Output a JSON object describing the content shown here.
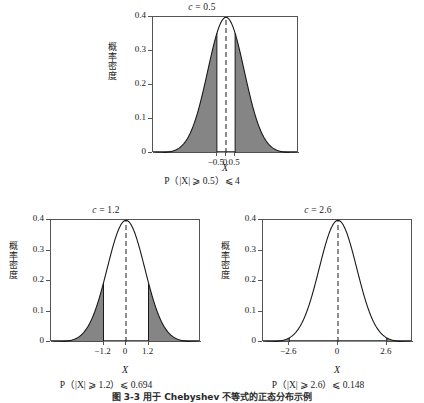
{
  "figure": {
    "caption": "图 3-3  用于 Chebyshev 不等式的正态分布示例",
    "axis_label_y": "概率密度",
    "axis_label_x": "X"
  },
  "chart_data": [
    {
      "id": "top",
      "type": "area",
      "title": "c = 0.5",
      "c_symbol": "c",
      "c_equals": " = ",
      "c_value": "0.5",
      "xlabel": "X",
      "ylabel": "概率密度",
      "caption": "P（|X| ⩾ 0.5）⩽ 4",
      "ylim": [
        0,
        0.4
      ],
      "yticks": [
        0,
        0.1,
        0.2,
        0.3,
        0.4
      ],
      "ytick_labels": [
        "0",
        "0.1",
        "0.2",
        "0.3",
        "0.4"
      ],
      "xlim": [
        -4,
        4
      ],
      "xticks": [
        -0.5,
        0,
        0.5
      ],
      "xtick_labels": [
        "−0.5",
        "0",
        "0.5"
      ],
      "distribution": "standard-normal",
      "mean": 0,
      "sd": 1,
      "peak_density": 0.3989,
      "threshold": 0.5,
      "shaded_tails": [
        [
          -4,
          -0.5
        ],
        [
          0.5,
          4
        ]
      ],
      "shade_color": "#858585",
      "curve_color": "#1a1a1a",
      "dashed_center_line_x": 0,
      "grid": false,
      "legend": "none"
    },
    {
      "id": "bottom-left",
      "type": "area",
      "title": "c = 1.2",
      "c_symbol": "c",
      "c_equals": " = ",
      "c_value": "1.2",
      "xlabel": "X",
      "ylabel": "概率密度",
      "caption": "P（|X| ⩾ 1.2）⩽ 0.694",
      "ylim": [
        0,
        0.4
      ],
      "yticks": [
        0,
        0.1,
        0.2,
        0.3,
        0.4
      ],
      "ytick_labels": [
        "0",
        "0.1",
        "0.2",
        "0.3",
        "0.4"
      ],
      "xlim": [
        -4,
        4
      ],
      "xticks": [
        -1.2,
        0,
        1.2
      ],
      "xtick_labels": [
        "−1.2",
        "0",
        "1.2"
      ],
      "distribution": "standard-normal",
      "mean": 0,
      "sd": 1,
      "peak_density": 0.3989,
      "threshold": 1.2,
      "shaded_tails": [
        [
          -4,
          -1.2
        ],
        [
          1.2,
          4
        ]
      ],
      "shade_color": "#858585",
      "curve_color": "#1a1a1a",
      "dashed_center_line_x": 0,
      "grid": false,
      "legend": "none"
    },
    {
      "id": "bottom-right",
      "type": "area",
      "title": "c = 2.6",
      "c_symbol": "c",
      "c_equals": " = ",
      "c_value": "2.6",
      "xlabel": "X",
      "ylabel": "概率密度",
      "caption": "P（|X| ⩾ 2.6）⩽ 0.148",
      "ylim": [
        0,
        0.4
      ],
      "yticks": [
        0,
        0.1,
        0.2,
        0.3,
        0.4
      ],
      "ytick_labels": [
        "0",
        "0.1",
        "0.2",
        "0.3",
        "0.4"
      ],
      "xlim": [
        -4,
        4
      ],
      "xticks": [
        -2.6,
        0,
        2.6
      ],
      "xtick_labels": [
        "−2.6",
        "0",
        "2.6"
      ],
      "distribution": "standard-normal",
      "mean": 0,
      "sd": 1,
      "peak_density": 0.3989,
      "threshold": 2.6,
      "shaded_tails": [
        [
          -4,
          -2.6
        ],
        [
          2.6,
          4
        ]
      ],
      "shade_color": "#858585",
      "curve_color": "#1a1a1a",
      "dashed_center_line_x": 0,
      "grid": false,
      "legend": "none"
    }
  ]
}
